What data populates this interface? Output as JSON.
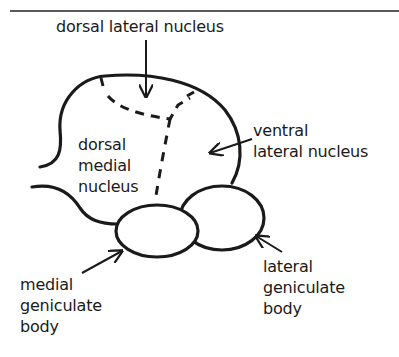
{
  "diagram": {
    "type": "anatomical line drawing",
    "labels": {
      "dorsal_lateral": "dorsal lateral nucleus",
      "dorsal_medial": [
        "dorsal",
        "medial",
        "nucleus"
      ],
      "ventral_lateral": [
        "ventral",
        "lateral nucleus"
      ],
      "medial_geniculate": [
        "medial",
        "geniculate",
        "body"
      ],
      "lateral_geniculate": [
        "lateral",
        "geniculate",
        "body"
      ]
    },
    "colors": {
      "stroke": "#1a1a1a",
      "background": "#ffffff"
    }
  }
}
